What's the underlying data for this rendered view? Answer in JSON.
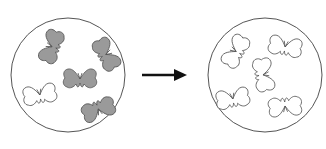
{
  "diagram": {
    "type": "before-after",
    "colors": {
      "outline": "#555555",
      "dark_butterfly": "#9a9a9a",
      "light_butterfly": "#ffffff",
      "arrow": "#111111"
    },
    "left_dish": {
      "cx": 68,
      "cy": 75,
      "r": 57,
      "butterflies": [
        {
          "x": 53,
          "y": 47,
          "rot": -70,
          "fill": "dark"
        },
        {
          "x": 105,
          "y": 55,
          "rot": 60,
          "fill": "dark"
        },
        {
          "x": 80,
          "y": 80,
          "rot": 0,
          "fill": "dark"
        },
        {
          "x": 40,
          "y": 96,
          "rot": -10,
          "fill": "light"
        },
        {
          "x": 98,
          "y": 108,
          "rot": 160,
          "fill": "dark"
        }
      ]
    },
    "arrow": {
      "x1": 142,
      "y1": 75,
      "x2": 187,
      "y2": 75
    },
    "right_dish": {
      "cx": 265,
      "cy": 75,
      "r": 57,
      "butterflies": [
        {
          "x": 237,
          "y": 52,
          "rot": -60,
          "fill": "light"
        },
        {
          "x": 285,
          "y": 48,
          "rot": 10,
          "fill": "light"
        },
        {
          "x": 262,
          "y": 75,
          "rot": 80,
          "fill": "light"
        },
        {
          "x": 233,
          "y": 100,
          "rot": -10,
          "fill": "light"
        },
        {
          "x": 285,
          "y": 105,
          "rot": 175,
          "fill": "light"
        }
      ]
    }
  }
}
